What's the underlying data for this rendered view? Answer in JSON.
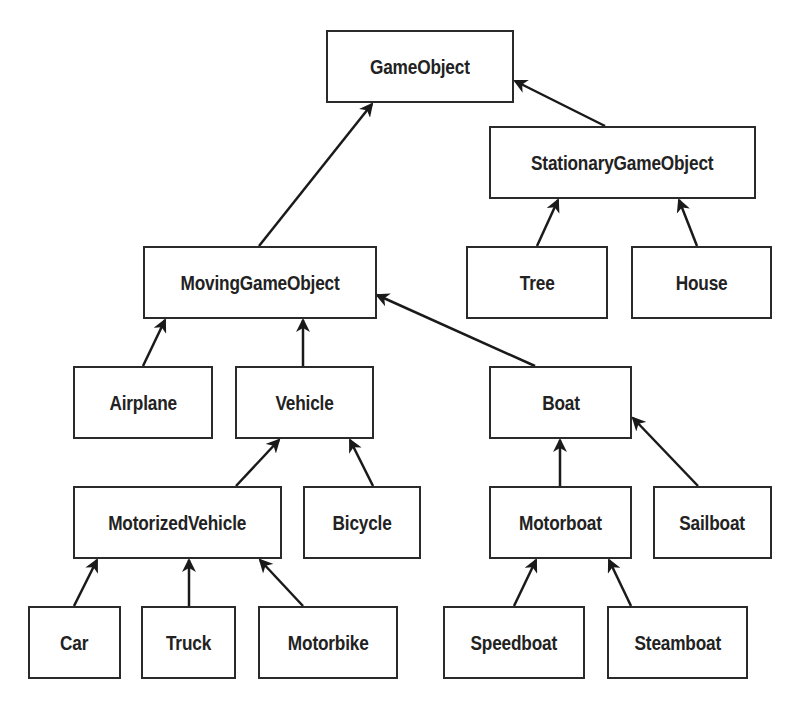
{
  "diagram": {
    "type": "class-hierarchy",
    "colors": {
      "border": "#2a2a2a",
      "text": "#222222",
      "background": "#ffffff"
    },
    "nodes": {
      "gameobject": {
        "label": "GameObject",
        "x": 326,
        "y": 30,
        "w": 188,
        "h": 73
      },
      "stationarygameobject": {
        "label": "StationaryGameObject",
        "x": 489,
        "y": 126,
        "w": 267,
        "h": 73
      },
      "tree": {
        "label": "Tree",
        "x": 466,
        "y": 246,
        "w": 142,
        "h": 73
      },
      "house": {
        "label": "House",
        "x": 631,
        "y": 246,
        "w": 141,
        "h": 73
      },
      "movinggameobject": {
        "label": "MovingGameObject",
        "x": 143,
        "y": 246,
        "w": 234,
        "h": 73
      },
      "airplane": {
        "label": "Airplane",
        "x": 73,
        "y": 366,
        "w": 140,
        "h": 73
      },
      "vehicle": {
        "label": "Vehicle",
        "x": 235,
        "y": 366,
        "w": 139,
        "h": 73
      },
      "boat": {
        "label": "Boat",
        "x": 489,
        "y": 366,
        "w": 143,
        "h": 73
      },
      "motorizedvehicle": {
        "label": "MotorizedVehicle",
        "x": 73,
        "y": 486,
        "w": 209,
        "h": 73
      },
      "bicycle": {
        "label": "Bicycle",
        "x": 303,
        "y": 486,
        "w": 118,
        "h": 73
      },
      "motorboat": {
        "label": "Motorboat",
        "x": 489,
        "y": 486,
        "w": 143,
        "h": 73
      },
      "sailboat": {
        "label": "Sailboat",
        "x": 653,
        "y": 486,
        "w": 119,
        "h": 73
      },
      "car": {
        "label": "Car",
        "x": 28,
        "y": 606,
        "w": 93,
        "h": 73
      },
      "truck": {
        "label": "Truck",
        "x": 141,
        "y": 606,
        "w": 95,
        "h": 73
      },
      "motorbike": {
        "label": "Motorbike",
        "x": 258,
        "y": 606,
        "w": 140,
        "h": 73
      },
      "speedboat": {
        "label": "Speedboat",
        "x": 443,
        "y": 606,
        "w": 142,
        "h": 73
      },
      "steamboat": {
        "label": "Steamboat",
        "x": 607,
        "y": 606,
        "w": 141,
        "h": 73
      }
    },
    "edges": [
      {
        "from": "movinggameobject",
        "to": "gameobject",
        "x1": 259,
        "y1": 246,
        "x2": 372,
        "y2": 104
      },
      {
        "from": "stationarygameobject",
        "to": "gameobject",
        "x1": 605,
        "y1": 126,
        "x2": 515,
        "y2": 81
      },
      {
        "from": "tree",
        "to": "stationarygameobject",
        "x1": 537,
        "y1": 246,
        "x2": 558,
        "y2": 200
      },
      {
        "from": "house",
        "to": "stationarygameobject",
        "x1": 697,
        "y1": 246,
        "x2": 679,
        "y2": 200
      },
      {
        "from": "airplane",
        "to": "movinggameobject",
        "x1": 143,
        "y1": 366,
        "x2": 165,
        "y2": 320
      },
      {
        "from": "vehicle",
        "to": "movinggameobject",
        "x1": 303,
        "y1": 366,
        "x2": 303,
        "y2": 320
      },
      {
        "from": "boat",
        "to": "movinggameobject",
        "x1": 535,
        "y1": 366,
        "x2": 377,
        "y2": 295
      },
      {
        "from": "motorizedvehicle",
        "to": "vehicle",
        "x1": 236,
        "y1": 486,
        "x2": 279,
        "y2": 440
      },
      {
        "from": "bicycle",
        "to": "vehicle",
        "x1": 373,
        "y1": 486,
        "x2": 350,
        "y2": 440
      },
      {
        "from": "motorboat",
        "to": "boat",
        "x1": 560,
        "y1": 486,
        "x2": 560,
        "y2": 440
      },
      {
        "from": "sailboat",
        "to": "boat",
        "x1": 698,
        "y1": 486,
        "x2": 633,
        "y2": 418
      },
      {
        "from": "car",
        "to": "motorizedvehicle",
        "x1": 74,
        "y1": 606,
        "x2": 97,
        "y2": 560
      },
      {
        "from": "truck",
        "to": "motorizedvehicle",
        "x1": 189,
        "y1": 606,
        "x2": 189,
        "y2": 560
      },
      {
        "from": "motorbike",
        "to": "motorizedvehicle",
        "x1": 303,
        "y1": 606,
        "x2": 260,
        "y2": 560
      },
      {
        "from": "speedboat",
        "to": "motorboat",
        "x1": 514,
        "y1": 606,
        "x2": 536,
        "y2": 560
      },
      {
        "from": "steamboat",
        "to": "motorboat",
        "x1": 631,
        "y1": 606,
        "x2": 609,
        "y2": 560
      }
    ]
  }
}
